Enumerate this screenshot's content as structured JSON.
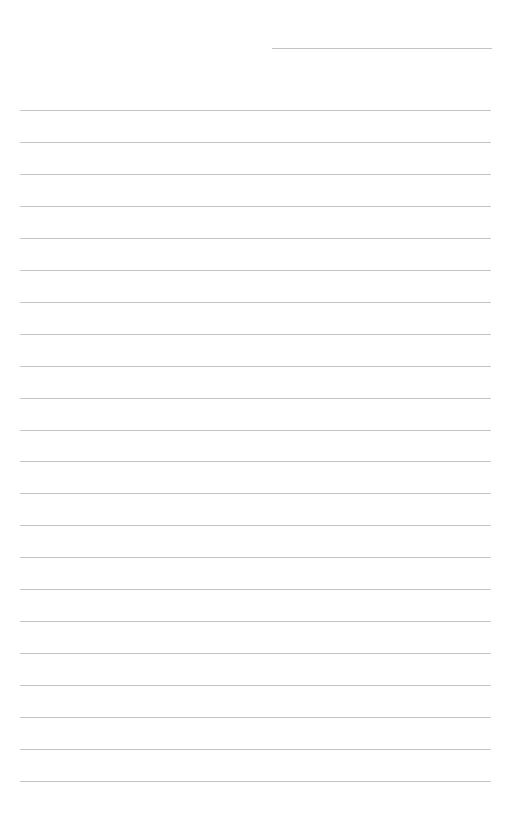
{
  "page": {
    "type": "lined-paper",
    "background": "#ffffff",
    "line_color": "#c4c4c4",
    "header_line": {
      "x1": 272,
      "x2": 492,
      "y": 48
    },
    "rules": {
      "count": 22,
      "x1": 20,
      "x2": 491,
      "first_y": 110,
      "last_y": 781
    }
  }
}
